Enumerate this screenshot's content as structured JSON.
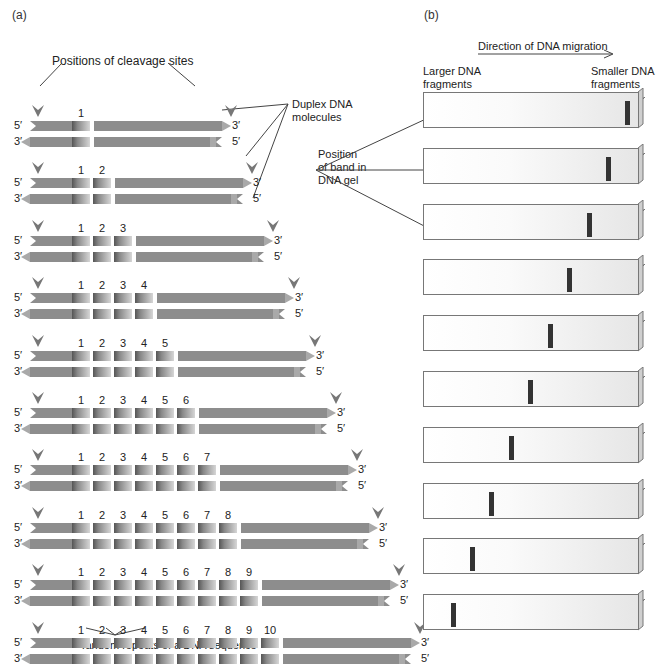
{
  "panel_a": {
    "label": "(a)",
    "cleavage_label": "Positions of cleavage sites",
    "duplex_label_line1": "Duplex DNA",
    "duplex_label_line2": "molecules",
    "tandem_label": "Tandem repeats of a DNA sequence",
    "end_labels": {
      "top_left": "5′",
      "top_right": "3′",
      "bottom_left": "3′",
      "bottom_right": "5′"
    },
    "rows": [
      {
        "repeats": 1,
        "numbers": [
          "1"
        ]
      },
      {
        "repeats": 2,
        "numbers": [
          "1",
          "2"
        ]
      },
      {
        "repeats": 3,
        "numbers": [
          "1",
          "2",
          "3"
        ]
      },
      {
        "repeats": 4,
        "numbers": [
          "1",
          "2",
          "3",
          "4"
        ]
      },
      {
        "repeats": 5,
        "numbers": [
          "1",
          "2",
          "3",
          "4",
          "5"
        ]
      },
      {
        "repeats": 6,
        "numbers": [
          "1",
          "2",
          "3",
          "4",
          "5",
          "6"
        ]
      },
      {
        "repeats": 7,
        "numbers": [
          "1",
          "2",
          "3",
          "4",
          "5",
          "6",
          "7"
        ]
      },
      {
        "repeats": 8,
        "numbers": [
          "1",
          "2",
          "3",
          "4",
          "5",
          "6",
          "7",
          "8"
        ]
      },
      {
        "repeats": 9,
        "numbers": [
          "1",
          "2",
          "3",
          "4",
          "5",
          "6",
          "7",
          "8",
          "9"
        ]
      },
      {
        "repeats": 10,
        "numbers": [
          "1",
          "2",
          "3",
          "4",
          "5",
          "6",
          "7",
          "8",
          "9",
          "10"
        ]
      }
    ]
  },
  "panel_b": {
    "label": "(b)",
    "migration_label": "Direction of DNA migration",
    "larger_label_line1": "Larger DNA",
    "larger_label_line2": "fragments",
    "smaller_label_line1": "Smaller DNA",
    "smaller_label_line2": "fragments",
    "band_label_line1": "Position",
    "band_label_line2": "of band in",
    "band_label_line3": "DNA gel",
    "gels": [
      {
        "repeats": 1,
        "band_x": 625
      },
      {
        "repeats": 2,
        "band_x": 606
      },
      {
        "repeats": 3,
        "band_x": 587
      },
      {
        "repeats": 4,
        "band_x": 567
      },
      {
        "repeats": 5,
        "band_x": 548
      },
      {
        "repeats": 6,
        "band_x": 528
      },
      {
        "repeats": 7,
        "band_x": 509
      },
      {
        "repeats": 8,
        "band_x": 489
      },
      {
        "repeats": 9,
        "band_x": 470
      },
      {
        "repeats": 10,
        "band_x": 451
      }
    ]
  },
  "colors": {
    "strand": "#8d8d8d",
    "band": "#333333",
    "gel_border": "#777777",
    "cleavage_mark": "#777777"
  }
}
